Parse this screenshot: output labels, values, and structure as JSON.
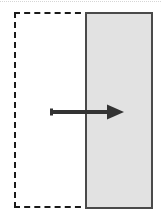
{
  "figure": {
    "type": "diagram",
    "title": "",
    "width": 161,
    "height": 221,
    "background_color": "#ffffff"
  },
  "elements": {
    "top_rule": {
      "name": "top-rule",
      "style": "dotted",
      "color": "#d6d6d6",
      "x": 0,
      "y": 1,
      "width": 161,
      "height": 1,
      "label": ""
    },
    "dashed_region": {
      "name": "dashed-region",
      "shape": "rectangle",
      "border_style": "dashed",
      "border_color": "#1a1a1a",
      "border_width": 2,
      "fill": "none",
      "x": 14,
      "y": 12,
      "width": 138,
      "height": 196,
      "label": ""
    },
    "gray_rect": {
      "name": "gray-rectangle",
      "shape": "rectangle",
      "border_style": "solid",
      "border_color": "#4a4a4a",
      "border_width": 2,
      "fill_color": "#e2e2e2",
      "x": 85,
      "y": 12,
      "width": 68,
      "height": 197,
      "label": ""
    },
    "arrow": {
      "name": "translation-arrow",
      "direction": "right",
      "color": "#333333",
      "tail_x": 51,
      "tail_y": 112,
      "tip_x": 124,
      "tip_y": 112,
      "shaft_thickness": 4,
      "head_width": 16,
      "head_height": 15,
      "label": ""
    }
  }
}
